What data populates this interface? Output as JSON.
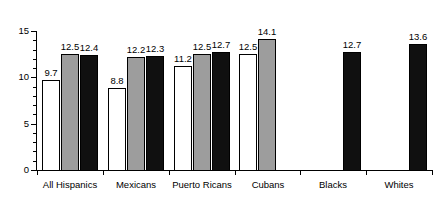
{
  "chart_data": {
    "type": "bar",
    "title": "",
    "subtitle": "",
    "xlabel": "",
    "ylabel": "",
    "ylim": [
      0,
      15
    ],
    "y_ticks": [
      0,
      5,
      10,
      15
    ],
    "y_tick_labels": [
      "0",
      "5",
      "10",
      "15"
    ],
    "y_minor_ticks": [
      1,
      2,
      3,
      4,
      6,
      7,
      8,
      9,
      11,
      12,
      13,
      14
    ],
    "grid": false,
    "legend": null,
    "orientation": "vertical",
    "categories": [
      "All Hispanics",
      "Mexicans",
      "Puerto Ricans",
      "Cubans",
      "Blacks",
      "Whites"
    ],
    "series": [
      {
        "name": "white",
        "fill": "#ffffff",
        "values": [
          9.7,
          8.8,
          11.2,
          12.5,
          null,
          null
        ],
        "labels": [
          "9.7",
          "8.8",
          "11.2",
          "12.5",
          "",
          ""
        ]
      },
      {
        "name": "gray",
        "fill": "#9d9d9d",
        "values": [
          12.5,
          12.2,
          12.5,
          14.1,
          null,
          null
        ],
        "labels": [
          "12.5",
          "12.2",
          "12.5",
          "14.1",
          "",
          ""
        ]
      },
      {
        "name": "black",
        "fill": "#101010",
        "values": [
          12.4,
          12.3,
          12.7,
          null,
          12.7,
          13.6
        ],
        "labels": [
          "12.4",
          "12.3",
          "12.7",
          "",
          "12.7",
          "13.6"
        ]
      }
    ]
  },
  "axis": {
    "y_label_15": "15",
    "y_label_10": "10",
    "y_label_5": "5",
    "y_label_0": "0"
  },
  "categories": {
    "c0": "All Hispanics",
    "c1": "Mexicans",
    "c2": "Puerto Ricans",
    "c3": "Cubans",
    "c4": "Blacks",
    "c5": "Whites"
  }
}
